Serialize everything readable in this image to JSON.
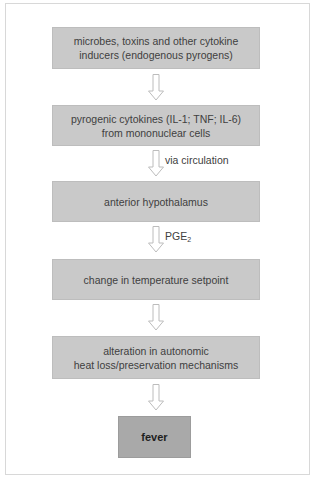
{
  "diagram": {
    "type": "flowchart",
    "direction": "top-to-bottom",
    "nodes": [
      {
        "id": "n1",
        "label": "microbes, toxins and other cytokine\ninducers (endogenous pyrogens)"
      },
      {
        "id": "n2",
        "label": "pyrogenic cytokines (IL-1; TNF; IL-6)\nfrom mononuclear cells"
      },
      {
        "id": "n3",
        "label": "anterior hypothalamus"
      },
      {
        "id": "n4",
        "label": "change in temperature setpoint"
      },
      {
        "id": "n5",
        "label": "alteration in autonomic\nheat loss/preservation mechanisms"
      },
      {
        "id": "n6",
        "label": "fever"
      }
    ],
    "edges": [
      {
        "from": "n1",
        "to": "n2",
        "label": ""
      },
      {
        "from": "n2",
        "to": "n3",
        "label": "via circulation"
      },
      {
        "from": "n3",
        "to": "n4",
        "label_main": "PGE",
        "label_sub": "2"
      },
      {
        "from": "n4",
        "to": "n5",
        "label": ""
      },
      {
        "from": "n5",
        "to": "n6",
        "label": ""
      }
    ]
  },
  "colors": {
    "box_fill": "#c9c9c9",
    "final_box_fill": "#a9a9a9",
    "arrow_stroke": "#bcbcbc",
    "frame_border": "#d8d8d8"
  }
}
